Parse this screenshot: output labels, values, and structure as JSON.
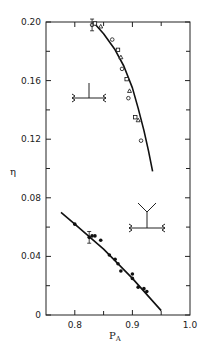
{
  "chart_data": {
    "type": "scatter",
    "title": "",
    "xlabel": "P_A",
    "xlabel_main": "P",
    "xlabel_sub": "A",
    "ylabel": "η",
    "xlim": [
      0.75,
      1.0
    ],
    "ylim": [
      0,
      0.2
    ],
    "x_ticks": [
      0.8,
      0.9,
      1.0
    ],
    "x_tick_labels": [
      "0.8",
      "0.9",
      "1.0"
    ],
    "x_minor_ticks": [
      0.85,
      0.95
    ],
    "y_ticks": [
      0,
      0.04,
      0.08,
      0.12,
      0.16,
      0.2
    ],
    "y_tick_labels": [
      "0",
      "0.04",
      "0.08",
      "0.12",
      "0.16",
      "0.20"
    ],
    "y_minor_ticks": [
      0.02,
      0.06,
      0.1,
      0.14,
      0.18
    ],
    "grid": false,
    "legend": "none",
    "series": [
      {
        "name": "upper (T-shaped monomer)",
        "marker": "open",
        "points": [
          [
            0.83,
            0.198
          ],
          [
            0.835,
            0.199
          ],
          [
            0.845,
            0.197
          ],
          [
            0.865,
            0.188
          ],
          [
            0.875,
            0.181
          ],
          [
            0.88,
            0.176
          ],
          [
            0.882,
            0.168
          ],
          [
            0.89,
            0.161
          ],
          [
            0.895,
            0.153
          ],
          [
            0.893,
            0.148
          ],
          [
            0.905,
            0.135
          ],
          [
            0.91,
            0.133
          ],
          [
            0.915,
            0.119
          ]
        ],
        "fit_curve": [
          [
            0.832,
            0.2
          ],
          [
            0.85,
            0.192
          ],
          [
            0.87,
            0.181
          ],
          [
            0.885,
            0.17
          ],
          [
            0.9,
            0.155
          ],
          [
            0.91,
            0.141
          ],
          [
            0.92,
            0.126
          ],
          [
            0.928,
            0.112
          ],
          [
            0.935,
            0.098
          ]
        ]
      },
      {
        "name": "lower (Y-shaped monomer)",
        "marker": "filled",
        "points": [
          [
            0.8,
            0.062
          ],
          [
            0.825,
            0.053
          ],
          [
            0.83,
            0.054
          ],
          [
            0.835,
            0.054
          ],
          [
            0.845,
            0.051
          ],
          [
            0.86,
            0.041
          ],
          [
            0.87,
            0.038
          ],
          [
            0.875,
            0.035
          ],
          [
            0.88,
            0.03
          ],
          [
            0.9,
            0.028
          ],
          [
            0.9,
            0.025
          ],
          [
            0.91,
            0.019
          ],
          [
            0.92,
            0.018
          ],
          [
            0.925,
            0.016
          ]
        ],
        "fit_curve": [
          [
            0.776,
            0.07
          ],
          [
            0.8,
            0.062
          ],
          [
            0.85,
            0.045
          ],
          [
            0.9,
            0.025
          ],
          [
            0.95,
            0.003
          ]
        ]
      }
    ],
    "annotations": [
      {
        "type": "structure-icon",
        "shape": "T-branch",
        "near": "upper series",
        "position": [
          0.79,
          0.148
        ]
      },
      {
        "type": "structure-icon",
        "shape": "Y-branch",
        "near": "lower series",
        "position": [
          0.925,
          0.06
        ]
      }
    ]
  }
}
